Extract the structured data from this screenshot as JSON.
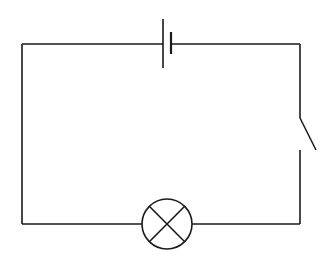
{
  "diagram": {
    "type": "circuit",
    "title": "",
    "components": [
      {
        "id": "battery",
        "kind": "cell",
        "label": ""
      },
      {
        "id": "switch",
        "kind": "open-switch",
        "label": ""
      },
      {
        "id": "lamp",
        "kind": "lamp",
        "label": ""
      }
    ],
    "colors": {
      "stroke": "#1a1a1a",
      "background": "#ffffff"
    }
  }
}
